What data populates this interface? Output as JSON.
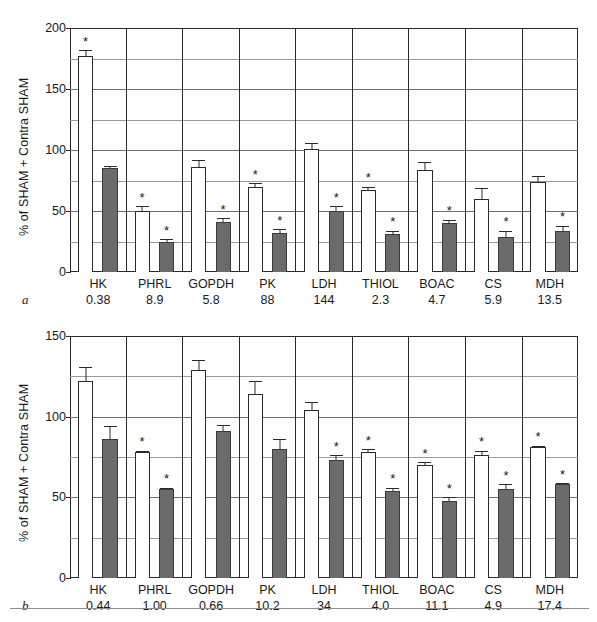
{
  "figure": {
    "bottom_rule": true,
    "colors": {
      "open_bar": "#ffffff",
      "filled_bar": "#6b6b6b",
      "axis": "#2b2b2b",
      "grid_minor": "#9a9a9a",
      "grid_major": "#6f6f6f"
    }
  },
  "chart_data": [
    {
      "type": "bar",
      "panel": "a",
      "panel_label": "a",
      "title": "",
      "xlabel": "",
      "ylabel": "% of SHAM + Contra SHAM",
      "ylim": [
        0,
        200
      ],
      "yticks": [
        0,
        50,
        100,
        150,
        200
      ],
      "ytick_labels": [
        "0",
        "50",
        "100",
        "150",
        "200"
      ],
      "yminor": [
        25,
        75,
        125,
        175
      ],
      "grid": true,
      "legend": "none",
      "categories": [
        "HK",
        "PHRL",
        "GOPDH",
        "PK",
        "LDH",
        "THIOL",
        "BOAC",
        "CS",
        "MDH"
      ],
      "category_values": [
        "0.38",
        "8.9",
        "5.8",
        "88",
        "144",
        "2.3",
        "4.7",
        "5.9",
        "13.5"
      ],
      "series": [
        {
          "name": "open",
          "fill": "open",
          "values": [
            177,
            50,
            86,
            70,
            101,
            67,
            84,
            60,
            74
          ],
          "errors": [
            5,
            4,
            6,
            3,
            5,
            3,
            6,
            9,
            5
          ],
          "significant": [
            true,
            true,
            false,
            true,
            false,
            true,
            false,
            false,
            false
          ]
        },
        {
          "name": "filled",
          "fill": "filled",
          "values": [
            85,
            25,
            41,
            32,
            50,
            31,
            40,
            29,
            34
          ],
          "errors": [
            1.5,
            2,
            3,
            3,
            4,
            3,
            3,
            5,
            4
          ],
          "significant": [
            false,
            true,
            true,
            true,
            true,
            true,
            true,
            true,
            true
          ]
        }
      ]
    },
    {
      "type": "bar",
      "panel": "b",
      "panel_label": "b",
      "title": "",
      "xlabel": "",
      "ylabel": "% of SHAM + Contra SHAM",
      "ylim": [
        0,
        150
      ],
      "yticks": [
        0,
        50,
        100,
        150
      ],
      "ytick_labels": [
        "0",
        "50",
        "100",
        "150"
      ],
      "yminor": [
        25,
        75,
        125
      ],
      "grid": true,
      "legend": "none",
      "categories": [
        "HK",
        "PHRL",
        "GOPDH",
        "PK",
        "LDH",
        "THIOL",
        "BOAC",
        "CS",
        "MDH"
      ],
      "category_values": [
        "0.44",
        "1.00",
        "0.66",
        "10.2",
        "34",
        "4.0",
        "11.1",
        "4.9",
        "17.4"
      ],
      "series": [
        {
          "name": "open",
          "fill": "open",
          "values": [
            122,
            78,
            129,
            114,
            104,
            78,
            70,
            76,
            81
          ],
          "errors": [
            9,
            1,
            6,
            8,
            5,
            2,
            2,
            3,
            1
          ],
          "significant": [
            false,
            true,
            false,
            false,
            false,
            true,
            true,
            true,
            true
          ]
        },
        {
          "name": "filled",
          "fill": "filled",
          "values": [
            86,
            55,
            91,
            80,
            73,
            54,
            48,
            55,
            58
          ],
          "errors": [
            8,
            1,
            4,
            6,
            3,
            2,
            2,
            3,
            1
          ],
          "significant": [
            false,
            true,
            false,
            false,
            true,
            true,
            true,
            true,
            true
          ]
        }
      ]
    }
  ]
}
